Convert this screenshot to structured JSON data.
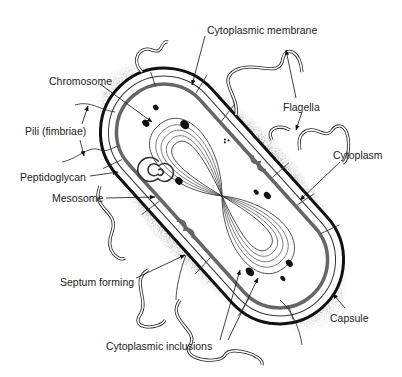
{
  "figure": {
    "labels": {
      "cytoplasmic_membrane": "Cytoplasmic membrane",
      "chromosome": "Chromosome",
      "flagella": "Flagella",
      "pili": "Pili (fimbriae)",
      "cytoplasm": "Cytoplasm",
      "peptidoglycan": "Peptidoglycan",
      "mesosome": "Mesosome",
      "septum_forming": "Septum forming",
      "capsule": "Capsule",
      "cytoplasmic_inclusions": "Cytoplasmic inclusions"
    }
  },
  "colors": {
    "ink": "#111111",
    "membrane": "#555555",
    "stipple": "#888888",
    "background": "#ffffff"
  }
}
